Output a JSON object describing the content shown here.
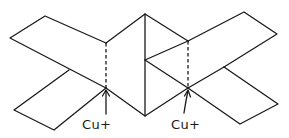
{
  "diagram": {
    "stroke_color": "#1a1a1a",
    "background_color": "#ffffff",
    "labels": [
      {
        "id": "cut-left",
        "text": "Cu+",
        "x": 82,
        "y": 120
      },
      {
        "id": "cut-right",
        "text": "Cu+",
        "x": 171,
        "y": 120
      }
    ],
    "cut_lines": [
      {
        "id": "left",
        "x": 106,
        "y1": 43,
        "y2": 88
      },
      {
        "id": "right",
        "x": 188,
        "y1": 41,
        "y2": 88
      }
    ]
  }
}
